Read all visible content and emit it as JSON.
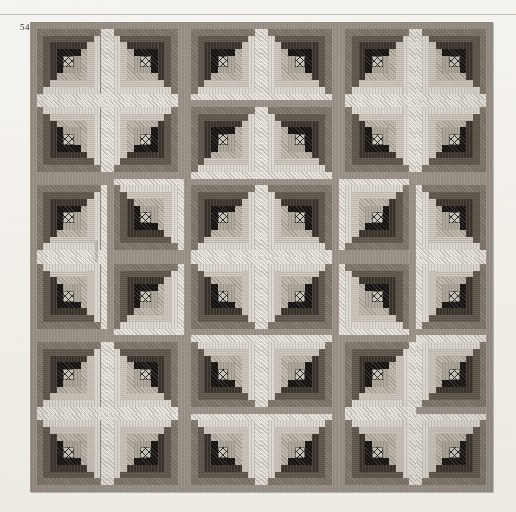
{
  "plate": {
    "figure_number": "54",
    "rule_visible": true
  },
  "quilt": {
    "name": "log-cabin-barn-raising-quilt",
    "grid_rows": 6,
    "grid_cols": 6,
    "strips_per_block": 5,
    "centre_motif": "cross-hatch-lattice",
    "palette": {
      "dark": [
        "#15120f",
        "#3b342c",
        "#5d554a",
        "#7d7468",
        "#9a9287"
      ],
      "light": [
        "#b4ada1",
        "#c6bfb4",
        "#d6d0c6",
        "#e4dfd6",
        "#efebe3"
      ],
      "centre": "#cfcabf",
      "centre_thread": "#141210",
      "seam": "#6f6a63",
      "paper": "#f4f2ee",
      "rule": "#b9b5ac"
    },
    "orientations": [
      [
        "tl",
        "tr",
        "tl",
        "tr",
        "tl",
        "tr"
      ],
      [
        "bl",
        "br",
        "tl",
        "tr",
        "bl",
        "br"
      ],
      [
        "tl",
        "bl",
        "tl",
        "tr",
        "br",
        "tr"
      ],
      [
        "bl",
        "tl",
        "bl",
        "br",
        "tr",
        "br"
      ],
      [
        "tl",
        "tr",
        "bl",
        "br",
        "tl",
        "br"
      ],
      [
        "bl",
        "br",
        "bl",
        "br",
        "bl",
        "br"
      ]
    ],
    "orientation_legend": {
      "tl": "dark-top-left",
      "tr": "dark-top-right",
      "bl": "dark-bottom-left",
      "br": "dark-bottom-right"
    }
  }
}
